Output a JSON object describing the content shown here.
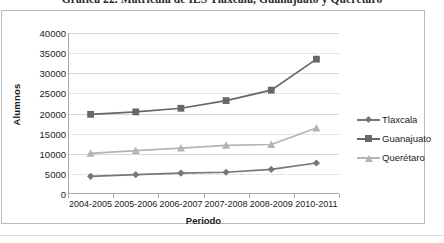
{
  "caption": "Gráfica 22. Matrícula de IES Tlaxcala, Guanajuato y Querétaro",
  "chart_data": {
    "type": "line",
    "title": "",
    "xlabel": "Periodo",
    "ylabel": "Alumnos",
    "categories": [
      "2004-2005",
      "2005-2006",
      "2006-2007",
      "2007-2008",
      "2008-2009",
      "2010-2011"
    ],
    "ylim": [
      0,
      40000
    ],
    "ytick_step": 5000,
    "yticks": [
      "40000",
      "35000",
      "30000",
      "25000",
      "20000",
      "15000",
      "10000",
      "5000",
      "0"
    ],
    "grid": true,
    "legend_position": "right",
    "series": [
      {
        "name": "Tlaxcala",
        "marker": "diamond",
        "color": "#767676",
        "values": [
          4400,
          4800,
          5200,
          5400,
          6100,
          7700
        ]
      },
      {
        "name": "Guanajuato",
        "marker": "square",
        "color": "#676767",
        "values": [
          19800,
          20400,
          21300,
          23200,
          25800,
          33500
        ]
      },
      {
        "name": "Querétaro",
        "marker": "triangle",
        "color": "#b4b4b4",
        "values": [
          10100,
          10800,
          11400,
          12100,
          12300,
          16400
        ]
      }
    ]
  },
  "colors": {
    "frame": "#b9b9b9",
    "axis": "#a8a8a8",
    "gridline": "#d6d6d6",
    "text": "#1b1b1b"
  }
}
